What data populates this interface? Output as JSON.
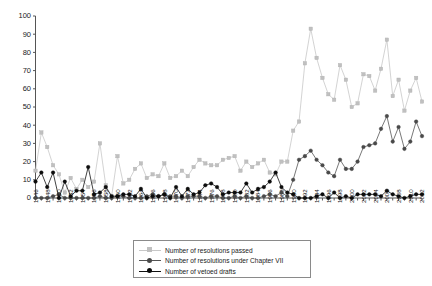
{
  "chart_data": {
    "type": "line",
    "title": "",
    "xlabel": "",
    "ylabel": "",
    "ylim": [
      0,
      100
    ],
    "ytick_labels": [
      "0",
      "10",
      "20",
      "30",
      "40",
      "50",
      "60",
      "70",
      "80",
      "90",
      "100"
    ],
    "ytick_values": [
      0,
      10,
      20,
      30,
      40,
      50,
      60,
      70,
      80,
      90,
      100
    ],
    "grid": false,
    "legend_position": "bottom-center",
    "x": [
      1946,
      1947,
      1948,
      1949,
      1950,
      1951,
      1952,
      1953,
      1954,
      1955,
      1956,
      1957,
      1958,
      1959,
      1960,
      1961,
      1962,
      1963,
      1964,
      1965,
      1966,
      1967,
      1968,
      1969,
      1970,
      1971,
      1972,
      1973,
      1974,
      1975,
      1976,
      1977,
      1978,
      1979,
      1980,
      1981,
      1982,
      1983,
      1984,
      1985,
      1986,
      1987,
      1988,
      1989,
      1990,
      1991,
      1992,
      1993,
      1994,
      1995,
      1996,
      1997,
      1998,
      1999,
      2000,
      2001,
      2002,
      2003,
      2004,
      2005,
      2006,
      2007,
      2008,
      2009,
      2010,
      2011,
      2012
    ],
    "xtick_labels": [
      "1946",
      "1948",
      "1950",
      "1952",
      "1954",
      "1956",
      "1958",
      "1960",
      "1962",
      "1964",
      "1966",
      "1968",
      "1970",
      "1972",
      "1974",
      "1976",
      "1978",
      "1980",
      "1982",
      "1984",
      "1986",
      "1988",
      "1990",
      "1992",
      "1994",
      "1996",
      "1998",
      "2000",
      "2002",
      "2004",
      "2006",
      "2008",
      "2010",
      "2012"
    ],
    "series": [
      {
        "name": "Number of resolutions passed",
        "color": "#c0c0c0",
        "marker": "square",
        "values": [
          15,
          36,
          28,
          18,
          13,
          3,
          11,
          5,
          10,
          6,
          9,
          30,
          7,
          1,
          23,
          8,
          10,
          16,
          19,
          11,
          13,
          12,
          19,
          11,
          12,
          15,
          12,
          17,
          21,
          19,
          18,
          18,
          21,
          22,
          23,
          15,
          20,
          17,
          19,
          21,
          14,
          13,
          20,
          20,
          37,
          42,
          74,
          93,
          77,
          66,
          57,
          54,
          73,
          65,
          50,
          52,
          68,
          67,
          59,
          71,
          87,
          56,
          65,
          48,
          59,
          66,
          53
        ],
        "ylim": [
          0,
          100
        ]
      },
      {
        "name": "Number of resolutions under Chapter VII",
        "color": "#4a4a4a",
        "marker": "circle",
        "values": [
          0,
          0,
          0,
          1,
          2,
          0,
          0,
          0,
          0,
          0,
          0,
          1,
          0,
          0,
          1,
          1,
          0,
          0,
          0,
          1,
          2,
          1,
          2,
          1,
          1,
          0,
          1,
          1,
          1,
          0,
          1,
          1,
          0,
          0,
          1,
          0,
          1,
          0,
          0,
          1,
          2,
          1,
          3,
          1,
          10,
          21,
          23,
          26,
          21,
          18,
          14,
          12,
          21,
          16,
          16,
          20,
          28,
          29,
          30,
          38,
          45,
          31,
          39,
          27,
          31,
          42,
          34
        ],
        "ylim": [
          0,
          100
        ]
      },
      {
        "name": "Number of vetoed drafts",
        "color": "#0d0d0d",
        "marker": "circle",
        "values": [
          9,
          14,
          6,
          14,
          0,
          9,
          1,
          4,
          4,
          17,
          2,
          3,
          6,
          1,
          1,
          2,
          2,
          1,
          5,
          0,
          1,
          1,
          2,
          0,
          6,
          1,
          5,
          2,
          3,
          7,
          8,
          6,
          2,
          3,
          3,
          3,
          8,
          3,
          5,
          6,
          9,
          14,
          6,
          3,
          2,
          0,
          0,
          0,
          1,
          2,
          0,
          3,
          0,
          1,
          0,
          2,
          2,
          2,
          2,
          1,
          4,
          2,
          1,
          0,
          1,
          2,
          2
        ],
        "ylim": [
          0,
          100
        ]
      }
    ]
  },
  "legend": {
    "items": [
      {
        "label": "Number of resolutions passed"
      },
      {
        "label": "Number of resolutions under Chapter VII"
      },
      {
        "label": "Number of vetoed drafts"
      }
    ]
  }
}
